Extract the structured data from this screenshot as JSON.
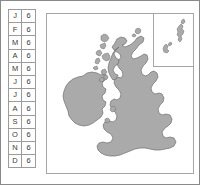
{
  "figure": {
    "kind": "map-with-month-table",
    "frame_border_color": "#8a8a8a",
    "land_fill_color": "#aaaaaa",
    "land_stroke_color": "#6e6e6e",
    "panel_border_color": "#a6a6a6",
    "background_color": "#ffffff"
  },
  "month_table": {
    "columns": [
      "month",
      "value"
    ],
    "rows": [
      {
        "month": "J",
        "value": "6"
      },
      {
        "month": "F",
        "value": "6"
      },
      {
        "month": "M",
        "value": "6"
      },
      {
        "month": "A",
        "value": "6"
      },
      {
        "month": "M",
        "value": "6"
      },
      {
        "month": "J",
        "value": "6"
      },
      {
        "month": "J",
        "value": "6"
      },
      {
        "month": "A",
        "value": "6"
      },
      {
        "month": "S",
        "value": "6"
      },
      {
        "month": "O",
        "value": "6"
      },
      {
        "month": "N",
        "value": "6"
      },
      {
        "month": "D",
        "value": "6"
      }
    ]
  },
  "map": {
    "name": "british-isles-map",
    "regions": [
      "Great Britain",
      "Ireland",
      "Hebrides",
      "Orkney"
    ],
    "inset": {
      "name": "shetland-inset",
      "regions": [
        "Shetland Islands"
      ]
    }
  }
}
